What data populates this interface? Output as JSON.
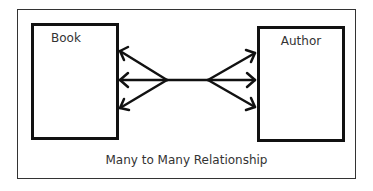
{
  "diagram": {
    "title": "Many to Many Relationship",
    "entities": [
      {
        "id": "book",
        "label": "Book"
      },
      {
        "id": "author",
        "label": "Author"
      }
    ],
    "relationship": {
      "type": "many-to-many",
      "from": "book",
      "to": "author",
      "from_cardinality": "many",
      "to_cardinality": "many"
    },
    "colors": {
      "stroke": "#111111",
      "text": "#333333",
      "background": "#ffffff"
    }
  }
}
